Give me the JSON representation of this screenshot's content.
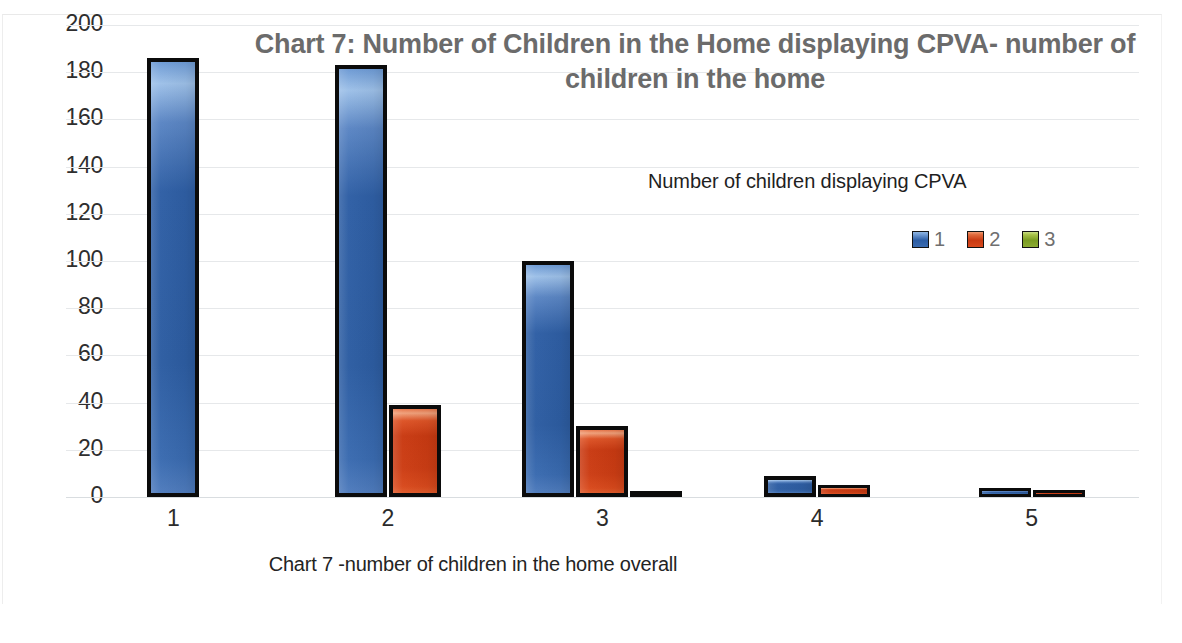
{
  "chart_data": {
    "type": "bar",
    "title": "Chart 7: Number of Children in the Home displaying CPVA- number of children in the home",
    "title_line1": "Chart 7: Number of Children in the Home displaying CPVA- number of",
    "title_line2": "children in the home",
    "xlabel": "Chart 7 -number of children in the home overall",
    "ylabel": "",
    "categories": [
      "1",
      "2",
      "3",
      "4",
      "5"
    ],
    "series": [
      {
        "name": "1",
        "color": "#2c5da4",
        "values": [
          186,
          183,
          100,
          9,
          4
        ]
      },
      {
        "name": "2",
        "color": "#c93a12",
        "values": [
          0,
          39,
          30,
          5,
          3
        ]
      },
      {
        "name": "3",
        "color": "#7a9c22",
        "values": [
          0,
          0,
          2,
          0,
          0
        ]
      }
    ],
    "ylim": [
      0,
      200
    ],
    "ytick_step": 20,
    "yticks": [
      "200",
      "180",
      "160",
      "140",
      "120",
      "100",
      "80",
      "60",
      "40",
      "20",
      "0"
    ],
    "grid": true,
    "legend_position": "right-inside",
    "legend_title": "Number of children displaying CPVA",
    "legend_entries": [
      "1",
      "2",
      "3"
    ]
  }
}
